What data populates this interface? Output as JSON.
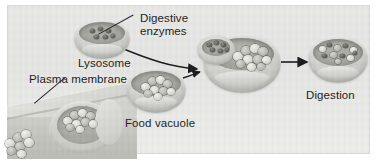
{
  "figure": {
    "background_color": "#e8e8e6",
    "plate_border_color": "#dcdcda",
    "ink_color": "#1d1d1b"
  },
  "labels": {
    "digestive_enzymes": "Digestive\nenzymes",
    "lysosome": "Lysosome",
    "plasma_membrane": "Plasma membrane",
    "food_vacuole": "Food vacuole",
    "digestion": "Digestion"
  },
  "stages": [
    {
      "id": "engulfment",
      "name": "plasma-membrane-engulfment",
      "label_ref": "plasma_membrane",
      "description": "Plasma membrane invaginates around extracellular food particles",
      "food_particles": 9
    },
    {
      "id": "lysosome",
      "name": "lysosome-vesicle",
      "label_ref": "lysosome",
      "description": "Lysosome containing digestive enzymes",
      "enzyme_specks": 6
    },
    {
      "id": "food-vacuole",
      "name": "food-vacuole-vesicle",
      "label_ref": "food_vacuole",
      "description": "Food vacuole containing intact food particles",
      "food_particles": 9
    },
    {
      "id": "fusion",
      "name": "lysosome-vacuole-fusion",
      "label_ref": null,
      "description": "Lysosome fuses with food vacuole, enzymes enter lumen",
      "enzyme_specks": 6,
      "food_particles": 10
    },
    {
      "id": "digestion",
      "name": "digestion-vesicle",
      "label_ref": "digestion",
      "description": "Food is broken down into small fragments",
      "fragments": 11
    }
  ],
  "arrows": [
    {
      "name": "arrow-food-into-cell",
      "from": "extracellular food",
      "to": "membrane pocket",
      "style": "straight"
    },
    {
      "name": "arrow-pocket-to-food-vacuole",
      "from": "membrane pocket",
      "to": "food vacuole",
      "style": "straight"
    },
    {
      "name": "arrow-lysosome-to-fusion",
      "from": "lysosome",
      "to": "fusion vesicle",
      "style": "curved"
    },
    {
      "name": "arrow-vacuole-to-fusion",
      "from": "food vacuole",
      "to": "fusion vesicle",
      "style": "curved"
    },
    {
      "name": "arrow-fusion-to-digestion",
      "from": "fusion vesicle",
      "to": "digestion vesicle",
      "style": "straight"
    }
  ],
  "leader_lines": [
    {
      "name": "leader-digestive-enzymes",
      "label_ref": "digestive_enzymes",
      "points_to": "lysosome enzymes"
    },
    {
      "name": "leader-plasma-membrane",
      "label_ref": "plasma_membrane",
      "points_to": "cell surface"
    }
  ]
}
